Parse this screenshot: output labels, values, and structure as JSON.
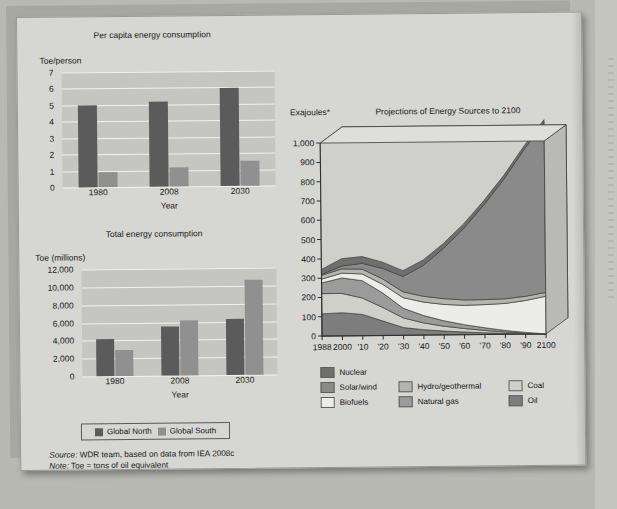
{
  "figure": {
    "notes": [
      {
        "em": "Source:",
        "text": " WDR team, based on data from IEA 2008c"
      },
      {
        "em": "Note:",
        "text": " Toe = tons of oil equivalent"
      }
    ]
  },
  "bar_legend": {
    "items": [
      {
        "label": "Global North",
        "color": "#5b5b5b"
      },
      {
        "label": "Global South",
        "color": "#909090"
      }
    ]
  },
  "chart_data": [
    {
      "type": "bar",
      "title": "Per capita energy consumption",
      "ylabel": "Toe/person",
      "xlabel": "Year",
      "categories": [
        "1980",
        "2008",
        "2030"
      ],
      "yticks": [
        "0",
        "1",
        "2",
        "3",
        "4",
        "5",
        "6",
        "7"
      ],
      "ylim": [
        0,
        7
      ],
      "grid": true,
      "series": [
        {
          "name": "Global North",
          "color": "#5b5b5b",
          "values": [
            5.0,
            5.15,
            5.95
          ]
        },
        {
          "name": "Global South",
          "color": "#909090",
          "values": [
            0.9,
            1.15,
            1.55
          ]
        }
      ]
    },
    {
      "type": "bar",
      "title": "Total energy consumption",
      "ylabel": "Toe (millions)",
      "xlabel": "Year",
      "categories": [
        "1980",
        "2008",
        "2030"
      ],
      "yticks": [
        "0",
        "2,000",
        "4,000",
        "6,000",
        "8,000",
        "10,000",
        "12,000"
      ],
      "ylim": [
        0,
        12000
      ],
      "grid": true,
      "series": [
        {
          "name": "Global North",
          "color": "#5b5b5b",
          "values": [
            4100,
            5500,
            6300
          ]
        },
        {
          "name": "Global South",
          "color": "#909090",
          "values": [
            2950,
            6200,
            10600
          ]
        }
      ]
    },
    {
      "type": "area",
      "title": "Projections of Energy Sources to 2100",
      "ylabel": "Exajoules*",
      "xlabel": "",
      "ylim": [
        0,
        1000
      ],
      "yticks": [
        "0",
        "100",
        "200",
        "300",
        "400",
        "500",
        "600",
        "700",
        "800",
        "900",
        "1,000"
      ],
      "x": [
        1988,
        2000,
        2010,
        2020,
        2030,
        2040,
        2050,
        2060,
        2070,
        2080,
        2090,
        2100
      ],
      "xticklabels": [
        "1988",
        "2000",
        "'10",
        "'20",
        "'30",
        "'40",
        "'50",
        "'60",
        "'70",
        "'80",
        "'90",
        "2100"
      ],
      "grid": false,
      "legend_position": "below",
      "stacked": true,
      "series": [
        {
          "name": "Oil",
          "color": "#7d7d7d",
          "values": [
            115,
            120,
            110,
            75,
            40,
            28,
            20,
            14,
            9,
            5,
            2,
            0
          ]
        },
        {
          "name": "Coal",
          "color": "#cfcfcb",
          "values": [
            105,
            100,
            85,
            70,
            50,
            35,
            25,
            18,
            12,
            7,
            3,
            0
          ]
        },
        {
          "name": "Natural gas",
          "color": "#9b9b9b",
          "values": [
            55,
            80,
            90,
            75,
            50,
            38,
            28,
            20,
            14,
            8,
            4,
            0
          ]
        },
        {
          "name": "Biofuels",
          "color": "#ececea",
          "values": [
            20,
            25,
            35,
            45,
            55,
            70,
            85,
            100,
            120,
            140,
            165,
            195
          ]
        },
        {
          "name": "Hydro/geothermal",
          "color": "#b4b4b0",
          "values": [
            20,
            22,
            25,
            28,
            30,
            30,
            30,
            28,
            26,
            24,
            22,
            20
          ]
        },
        {
          "name": "Solar/wind",
          "color": "#8a8a8a",
          "values": [
            5,
            15,
            30,
            55,
            80,
            160,
            260,
            370,
            490,
            620,
            760,
            880
          ]
        },
        {
          "name": "Nuclear",
          "color": "#6f6f6f",
          "values": [
            25,
            38,
            35,
            32,
            30,
            28,
            26,
            24,
            22,
            20,
            18,
            15
          ]
        }
      ]
    }
  ],
  "area_legend": {
    "items": [
      {
        "label": "Nuclear",
        "color": "#6f6f6f"
      },
      {
        "label": "Hydro/geothermal",
        "color": "#b4b4b0"
      },
      {
        "label": "Coal",
        "color": "#cfcfcb"
      },
      {
        "label": "Solar/wind",
        "color": "#8a8a8a"
      },
      {
        "label": "Natural gas",
        "color": "#9b9b9b"
      },
      {
        "label": "Oil",
        "color": "#7d7d7d"
      },
      {
        "label": "Biofuels",
        "color": "#ececea"
      }
    ],
    "order": [
      0,
      1,
      2,
      3,
      4,
      5,
      6
    ]
  }
}
